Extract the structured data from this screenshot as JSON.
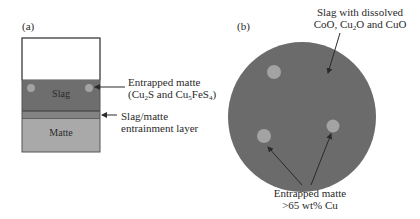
{
  "panel_a": {
    "label": "(a)",
    "layers": {
      "top_empty": {
        "name": "",
        "color": "#ffffff"
      },
      "slag": {
        "name": "Slag",
        "color": "#6e6e6e"
      },
      "entrainment": {
        "name": "",
        "color": "#8a8a8a"
      },
      "matte": {
        "name": "Matte",
        "color": "#a9a9a9"
      }
    },
    "droplet_color": "#a3a3a3",
    "annotations": {
      "entrapped_matte_line1": "Entrapped matte",
      "entrapped_matte_line2_pre": "(Cu",
      "entrapped_matte_sub1": "2",
      "entrapped_matte_line2_mid": "S and Cu",
      "entrapped_matte_sub2": "5",
      "entrapped_matte_line2_mid2": "FeS",
      "entrapped_matte_sub3": "4",
      "entrapped_matte_line2_post": ")",
      "entrainment_line1": "Slag/matte",
      "entrainment_line2": "entrainment layer"
    }
  },
  "panel_b": {
    "label": "(b)",
    "circle_color": "#6b6b6b",
    "droplet_color": "#a3a3a3",
    "annotations": {
      "slag_line1": "Slag with dissolved",
      "slag_line2_pre": "CoO, Cu",
      "slag_sub": "2",
      "slag_line2_post": "O and CuO",
      "matte_line1": "Entrapped matte",
      "matte_line2": ">65 wt% Cu"
    }
  }
}
